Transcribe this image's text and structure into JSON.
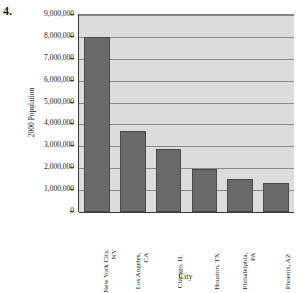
{
  "figure": {
    "question_number": "4."
  },
  "chart_data": {
    "type": "bar",
    "title": "",
    "xlabel": "City",
    "ylabel": "2000 Population",
    "categories": [
      "New York City, NY",
      "Los Angeles, CA",
      "Chicago, IL",
      "Houston, TX",
      "Philadelphia, PA",
      "Phoenix, AZ"
    ],
    "category_lines": [
      [
        "New York City,",
        "NY"
      ],
      [
        "Los Angeles,",
        "CA"
      ],
      [
        "Chicago, IL",
        ""
      ],
      [
        "Houston, TX",
        ""
      ],
      [
        "Philadelphia,",
        "PA"
      ],
      [
        "Phoenix, AZ",
        ""
      ]
    ],
    "values": [
      8000000,
      3700000,
      2900000,
      1950000,
      1520000,
      1320000
    ],
    "ylim": [
      0,
      9000000
    ],
    "ytick_values": [
      9000000,
      8000000,
      7000000,
      6000000,
      5000000,
      4000000,
      3000000,
      2000000,
      1000000,
      0
    ],
    "ytick_labels": [
      "9,000,000",
      "8,000,000",
      "7,000,000",
      "6,000,000",
      "5,000,000",
      "4,000,000",
      "3,000,000",
      "2,000,000",
      "1,000,000",
      "0"
    ],
    "grid": true,
    "legend": false,
    "bar_color": "#6a6a6a",
    "plot_background": "#dcdcdc",
    "axis_color": "#3a3a3a",
    "gridline_color": "#8a8a8a"
  }
}
